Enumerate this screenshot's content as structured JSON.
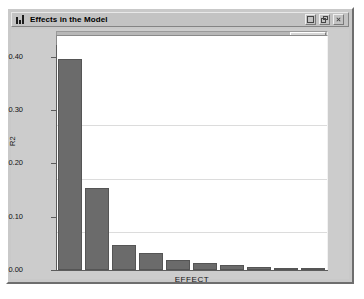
{
  "window": {
    "title": "Effects in the Model",
    "icon": "bar-chart-icon",
    "buttons": [
      {
        "name": "minimize-button",
        "glyph": "minimize"
      },
      {
        "name": "maximize-button",
        "glyph": "restore"
      },
      {
        "name": "close-button",
        "glyph": "close"
      }
    ]
  },
  "scrollbar": {
    "orientation": "horizontal",
    "thumb_position": "right"
  },
  "chart_data": {
    "type": "bar",
    "title": "Effects in the Model",
    "xlabel": "EFFECT",
    "ylabel": "R2",
    "ylim": [
      0.0,
      0.42
    ],
    "yticks": [
      0.0,
      0.1,
      0.2,
      0.3,
      0.4
    ],
    "ytick_labels": [
      "0.00",
      "0.10",
      "0.20",
      "0.30",
      "0.40"
    ],
    "grid": true,
    "legend": "none",
    "categories": [
      "1",
      "2",
      "3",
      "4",
      "5",
      "6",
      "7",
      "8",
      "9",
      "10"
    ],
    "values": [
      0.395,
      0.153,
      0.046,
      0.032,
      0.019,
      0.013,
      0.01,
      0.006,
      0.004,
      0.003
    ],
    "bar_color": "#6b6b6b",
    "plot_background": "#ffffff"
  },
  "colors": {
    "window_face": "#c9c9c9",
    "content_face": "#cccccc",
    "title_face": "#c3c3c3",
    "text": "#000000",
    "bar": "#6b6b6b",
    "grid": "#dcdcdc",
    "axis": "#5c5c5c"
  }
}
